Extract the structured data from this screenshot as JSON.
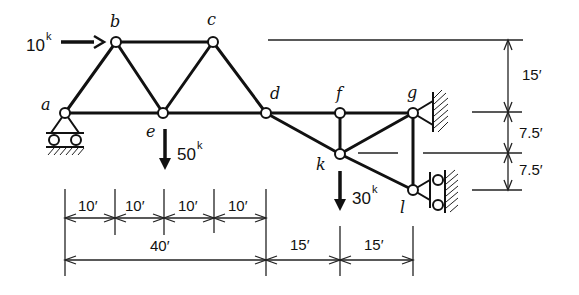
{
  "diagram": {
    "type": "truss",
    "nodes": {
      "a": "a",
      "b": "b",
      "c": "c",
      "d": "d",
      "e": "e",
      "f": "f",
      "g": "g",
      "k": "k",
      "l": "l"
    },
    "loads": {
      "horizontal_b": {
        "value": "10",
        "unit": "k"
      },
      "vertical_e": {
        "value": "50",
        "unit": "k"
      },
      "vertical_k": {
        "value": "30",
        "unit": "k"
      }
    },
    "dimensions": {
      "horizontal_panels": [
        "10′",
        "10′",
        "10′",
        "10′"
      ],
      "horizontal_total": "40′",
      "horizontal_right": [
        "15′",
        "15′"
      ],
      "vertical_top": "15′",
      "vertical_mid": "7.5′",
      "vertical_bottom": "7.5′"
    },
    "supports": {
      "a": "roller",
      "g": "pin-to-wall",
      "l": "roller-on-wall"
    }
  }
}
